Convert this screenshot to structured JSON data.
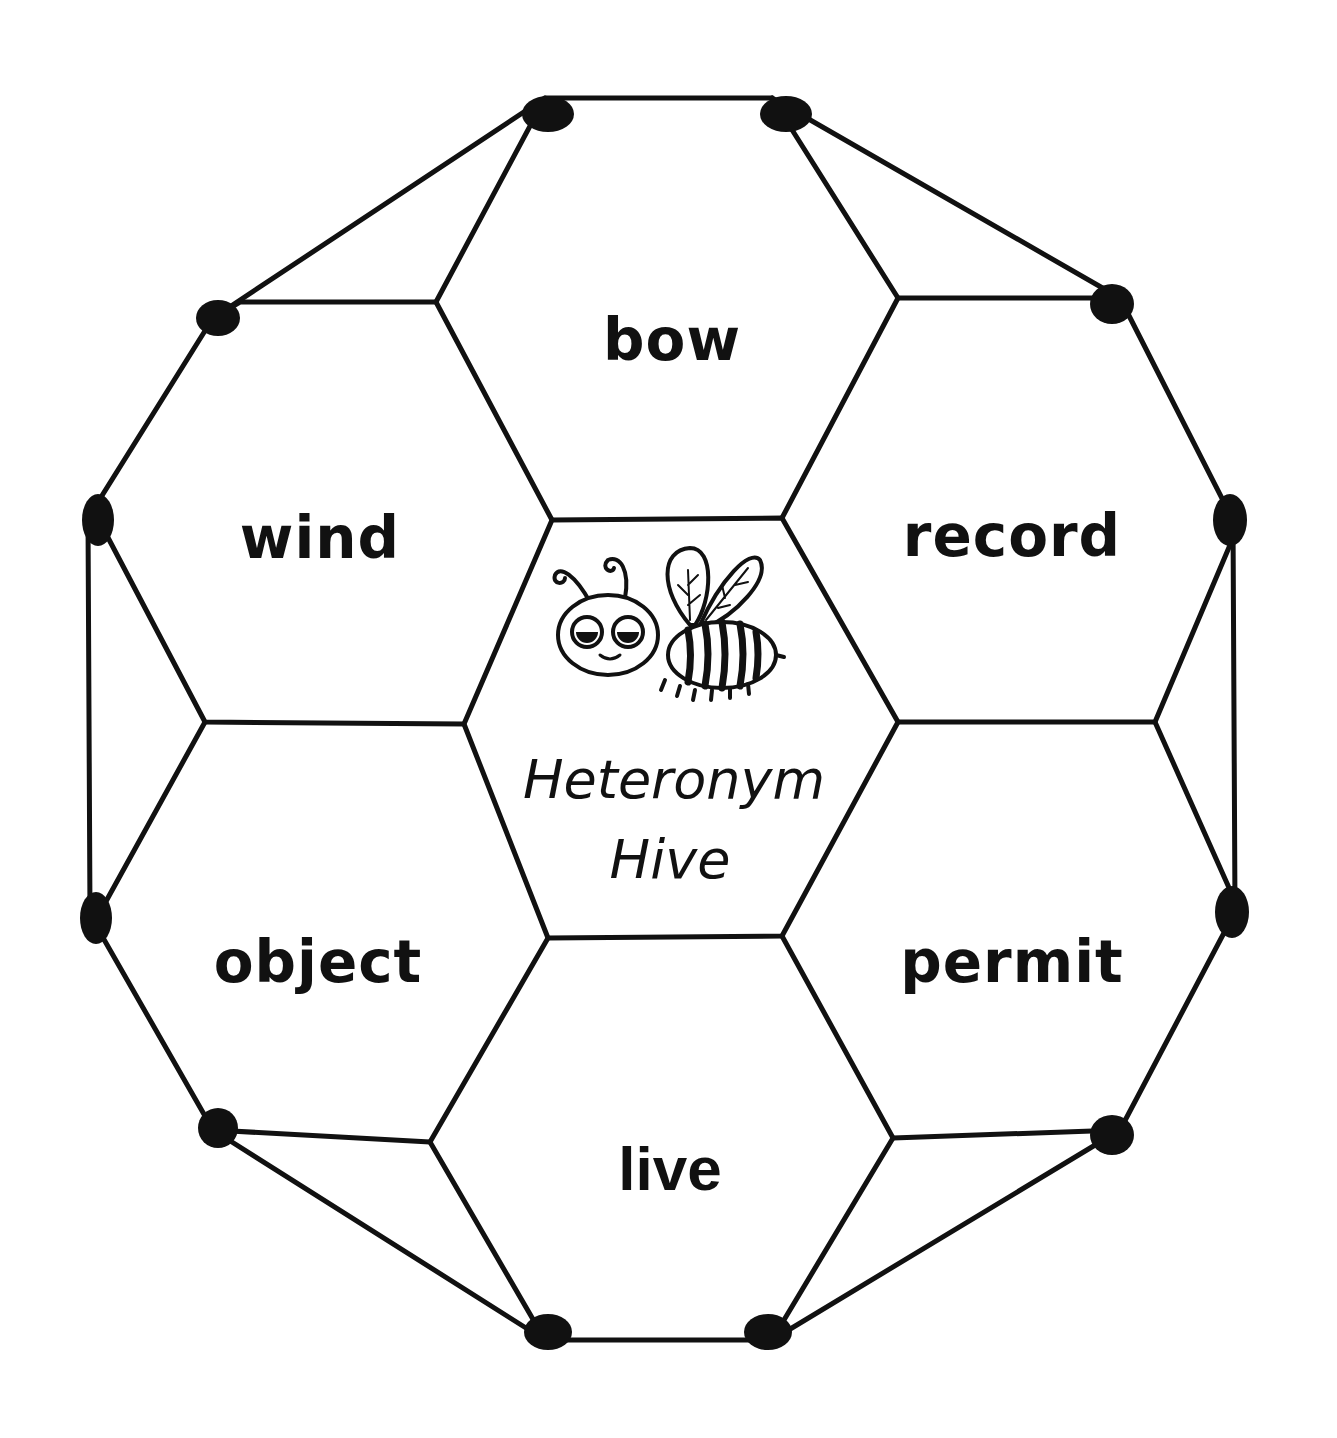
{
  "worksheet": {
    "title_line1": "Heteronym",
    "title_line2": "Hive",
    "mascot": "bee-illustration",
    "cells": [
      {
        "position": "top",
        "word": "bow"
      },
      {
        "position": "upper-left",
        "word": "wind"
      },
      {
        "position": "upper-right",
        "word": "record"
      },
      {
        "position": "lower-left",
        "word": "object"
      },
      {
        "position": "lower-right",
        "word": "permit"
      },
      {
        "position": "bottom",
        "word": "live"
      }
    ],
    "colors": {
      "ink": "#111111",
      "paper": "#ffffff"
    }
  }
}
